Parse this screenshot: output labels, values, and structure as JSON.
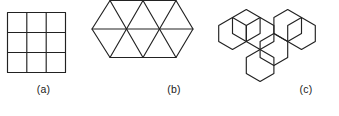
{
  "figure": {
    "name": "tessellation-figures",
    "background_color": "#ffffff",
    "stroke_color": "#222222",
    "width": 339,
    "height": 116,
    "panels": [
      {
        "id": "a",
        "caption": "(a)",
        "shape_name": "square-grid",
        "description": "3 by 3 grid of squares",
        "cells": 9,
        "rows": 3,
        "cols": 3,
        "bounds": {
          "x": 7,
          "y": 12,
          "width": 59,
          "height": 61
        }
      },
      {
        "id": "b",
        "caption": "(b)",
        "shape_name": "triangle-tessellation",
        "description": "Hexagonal region subdivided into 12 equilateral triangles",
        "cells": 12,
        "bounds": {
          "x": 92,
          "y": 14,
          "width": 101,
          "height": 58
        }
      },
      {
        "id": "c",
        "caption": "(c)",
        "shape_name": "hexagon-tessellation",
        "description": "Seven regular hexagons arranged in a honeycomb cluster",
        "cells": 7,
        "bounds": {
          "x": 218,
          "y": 8,
          "width": 113,
          "height": 70
        }
      }
    ]
  }
}
